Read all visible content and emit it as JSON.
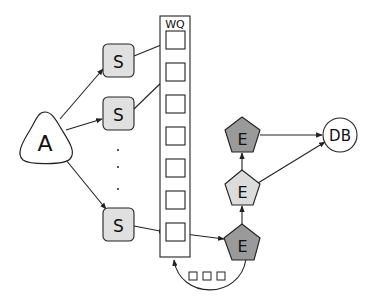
{
  "diagram": {
    "nodes": {
      "a": {
        "label": "A",
        "shape": "rounded-triangle"
      },
      "s1": {
        "label": "S",
        "shape": "rounded-square"
      },
      "s2": {
        "label": "S",
        "shape": "rounded-square"
      },
      "s3": {
        "label": "S",
        "shape": "rounded-square"
      },
      "wq": {
        "label": "WQ",
        "shape": "queue",
        "slots": 7
      },
      "e_top": {
        "label": "E",
        "shape": "pentagon"
      },
      "e_mid": {
        "label": "E",
        "shape": "pentagon"
      },
      "e_bot": {
        "label": "E",
        "shape": "pentagon"
      },
      "db": {
        "label": "DB",
        "shape": "circle"
      }
    },
    "ellipsis": ".",
    "colors": {
      "stroke": "#222222",
      "s_fill": "#e0e0e0",
      "e_dark_fill": "#9a9a9a",
      "e_light_fill": "#dcdcdc",
      "white": "#ffffff"
    },
    "edges": [
      "A->S1",
      "A->S2",
      "A->S3",
      "S1->WQ1",
      "S2->WQ2",
      "S3->WQ7",
      "WQ7->E_bot",
      "E_bot->E_mid",
      "E_mid->E_top",
      "E_top->DB",
      "E_mid->DB",
      "E_bot->WQ (loop)"
    ]
  }
}
